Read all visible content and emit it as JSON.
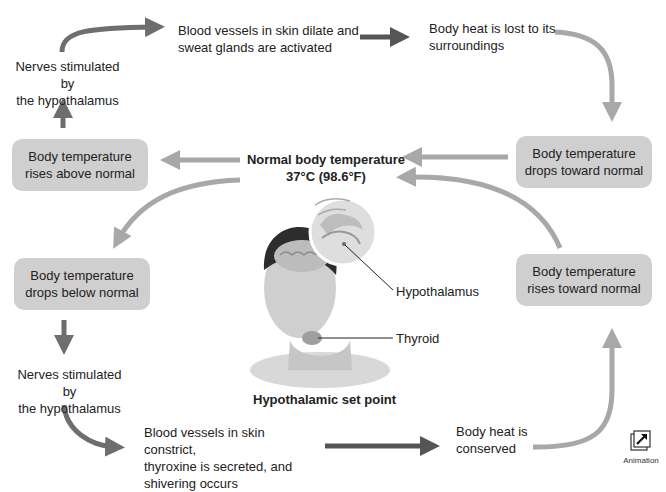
{
  "diagram": {
    "title": "Hypothalamic set point",
    "center_label": {
      "line1": "Normal body temperature",
      "line2": "37°C (98.6°F)"
    },
    "boxes": {
      "rises_above": {
        "line1": "Body temperature",
        "line2": "rises above normal"
      },
      "drops_toward": {
        "line1": "Body temperature",
        "line2": "drops toward normal"
      },
      "drops_below": {
        "line1": "Body temperature",
        "line2": "drops below normal"
      },
      "rises_toward": {
        "line1": "Body temperature",
        "line2": "rises toward normal"
      }
    },
    "top_loop": {
      "nerves": {
        "line1": "Nerves stimulated by",
        "line2": "the hypothalamus"
      },
      "response": {
        "line1": "Blood vessels in skin dilate and",
        "line2": "sweat glands are activated"
      },
      "result": {
        "line1": "Body heat is lost to its",
        "line2": "surroundings"
      }
    },
    "bottom_loop": {
      "nerves": {
        "line1": "Nerves stimulated by",
        "line2": "the hypothalamus"
      },
      "response": {
        "line1": "Blood vessels in skin constrict,",
        "line2": "thyroxine is secreted, and",
        "line3": "shivering occurs"
      },
      "result": {
        "line1": "Body heat is",
        "line2": "conserved"
      }
    },
    "figure_labels": {
      "hypothalamus": "Hypothalamus",
      "thyroid": "Thyroid"
    },
    "animation_button": {
      "label": "Animation",
      "icon": "external-arrow-icon"
    },
    "colors": {
      "box_fill": "#cfcfcf",
      "light_arrow": "#a8a8a8",
      "dark_arrow": "#555555",
      "medium_arrow": "#6e6e6e",
      "text": "#222222"
    }
  }
}
